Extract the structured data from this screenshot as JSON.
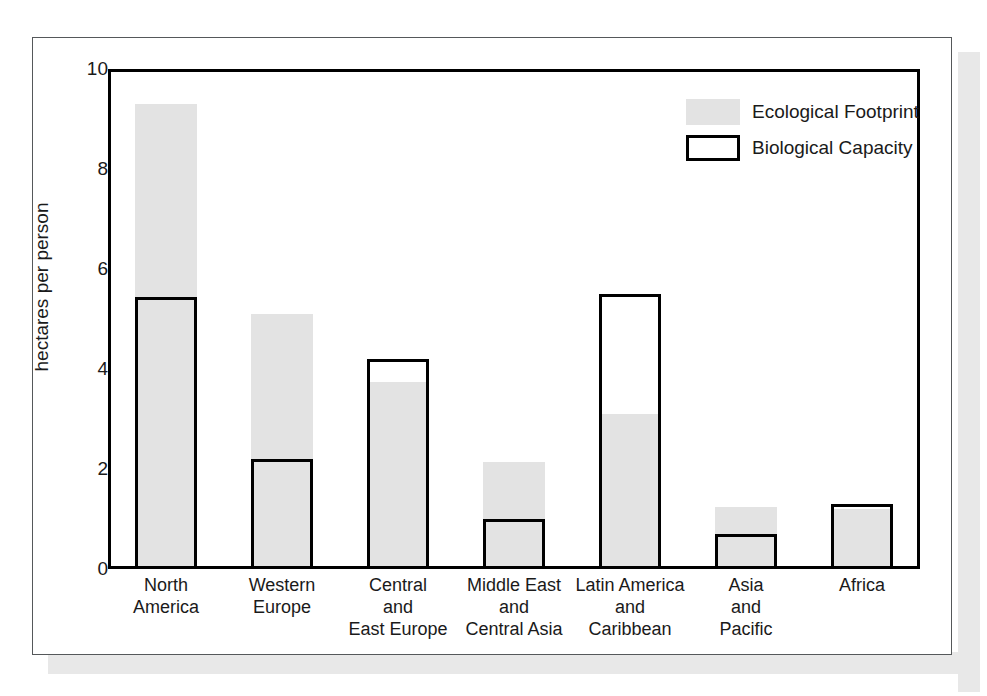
{
  "chart_data": {
    "type": "bar",
    "title": "",
    "xlabel": "",
    "ylabel": "hectares per person",
    "ylim": [
      0,
      10
    ],
    "yticks": [
      0,
      2,
      4,
      6,
      8,
      10
    ],
    "grid": false,
    "legend_position": "top-right",
    "categories": [
      "North\nAmerica",
      "Western\nEurope",
      "Central\nand\nEast Europe",
      "Middle East\nand\nCentral Asia",
      "Latin America\nand\nCaribbean",
      "Asia\nand\nPacific",
      "Africa"
    ],
    "category_lines": [
      [
        "North",
        "America"
      ],
      [
        "Western",
        "Europe"
      ],
      [
        "Central",
        "and",
        "East Europe"
      ],
      [
        "Middle East",
        "and",
        "Central Asia"
      ],
      [
        "Latin America",
        "and",
        "Caribbean"
      ],
      [
        "Asia",
        "and",
        "Pacific"
      ],
      [
        "Africa"
      ]
    ],
    "series": [
      {
        "name": "Ecological Footprint",
        "values": [
          9.3,
          5.1,
          3.75,
          2.15,
          3.1,
          1.25,
          1.2
        ]
      },
      {
        "name": "Biological Capacity",
        "values": [
          5.45,
          2.2,
          4.2,
          1.0,
          5.5,
          0.7,
          1.3
        ]
      }
    ]
  },
  "legend": {
    "items": [
      {
        "label": "Ecological Footprint",
        "style": "fill"
      },
      {
        "label": "Biological Capacity",
        "style": "outline"
      }
    ]
  },
  "colors": {
    "footprint_fill": "#e3e3e3",
    "capacity_outline": "#000000",
    "axis": "#000000",
    "text": "#1a1a1a",
    "page_border": "#55585a",
    "page_shadow": "#e8e8e8"
  }
}
